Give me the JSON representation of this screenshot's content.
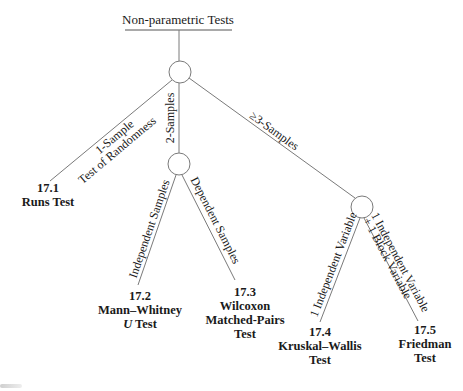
{
  "diagram": {
    "title": "Non-parametric Tests",
    "colors": {
      "line": "#7a7a7a",
      "text": "#1a1a1a",
      "background": "#ffffff"
    },
    "nodes": [
      {
        "id": "root",
        "cx": 180,
        "cy": 72,
        "r": 11
      },
      {
        "id": "two-samples",
        "cx": 179,
        "cy": 164,
        "r": 11
      },
      {
        "id": "three-samples",
        "cx": 362,
        "cy": 207,
        "r": 11
      }
    ],
    "edges": {
      "one_sample": {
        "label": "1-Sample",
        "sublabel": "Test of Randomness"
      },
      "two_samples": {
        "label": "2-Samples"
      },
      "three_samples": {
        "label": "≥3-Samples"
      },
      "independent_samples": {
        "label": "Independent Samples"
      },
      "dependent_samples": {
        "label": "Dependent Samples"
      },
      "one_independent_variable": {
        "label": "1 Independent Variable"
      },
      "one_iv_one_block": {
        "label": "1 Independent Variable",
        "sublabel": "+ 1 Block Variable"
      }
    },
    "leaves": {
      "runs": {
        "number": "17.1",
        "line1": "Runs Test"
      },
      "mann_whitney": {
        "number": "17.2",
        "line1": "Mann–Whitney",
        "line2_italic": "U",
        "line2_rest": " Test"
      },
      "wilcoxon": {
        "number": "17.3",
        "line1": "Wilcoxon",
        "line2": "Matched-Pairs",
        "line3": "Test"
      },
      "kruskal_wallis": {
        "number": "17.4",
        "line1": "Kruskal–Wallis",
        "line2": "Test"
      },
      "friedman": {
        "number": "17.5",
        "line1": "Friedman",
        "line2": "Test"
      }
    }
  }
}
